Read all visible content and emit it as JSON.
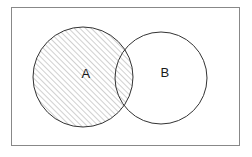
{
  "figure": {
    "kind": "venn-diagram",
    "title": "",
    "width": 252,
    "height": 157,
    "background_color": "#ffffff"
  },
  "universe_frame": {
    "name": "universal-set-rectangle",
    "label": "",
    "x": 11,
    "y": 7,
    "width": 229,
    "height": 139,
    "stroke_color": "#888888",
    "stroke_width": 1,
    "fill_color": "#ffffff"
  },
  "sets": [
    {
      "id": "A",
      "label": "A",
      "cx": 83,
      "cy": 77,
      "r": 50,
      "stroke_color": "#333333",
      "stroke_width": 1,
      "shaded": true,
      "label_x": 86,
      "label_y": 75
    },
    {
      "id": "B",
      "label": "B",
      "cx": 161,
      "cy": 78,
      "r": 46,
      "stroke_color": "#333333",
      "stroke_width": 1,
      "shaded": false,
      "label_x": 165,
      "label_y": 74
    }
  ],
  "shading": {
    "region": "A",
    "style": "diagonal-hatch",
    "direction": "up-right",
    "angle_degrees": 45,
    "spacing_px": 4,
    "line_color": "#777777",
    "line_width": 0.7
  }
}
